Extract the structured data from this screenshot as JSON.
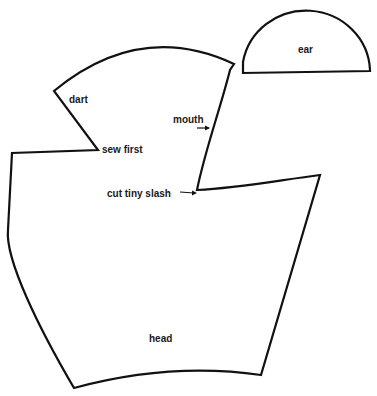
{
  "diagram": {
    "type": "sewing-pattern",
    "colors": {
      "stroke": "#111111",
      "background": "#ffffff",
      "text": "#1a1a1a"
    },
    "pieces": [
      {
        "name": "ear",
        "label": "ear",
        "shape": "semicircle"
      },
      {
        "name": "head",
        "label": "head",
        "shape": "polygon-curved"
      }
    ],
    "annotations": {
      "dart": "dart",
      "sew_first": "sew first",
      "mouth": "mouth",
      "cut_tiny_slash": "cut tiny slash"
    }
  }
}
